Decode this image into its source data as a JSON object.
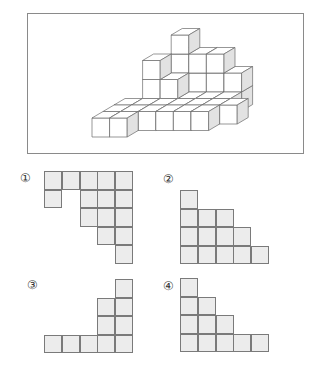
{
  "figure": {
    "frame": {
      "x": 27,
      "y": 13,
      "w": 277,
      "h": 141
    },
    "cube_style": {
      "front": "#ffffff",
      "top": "#ffffff",
      "side": "#e2e2e2",
      "stroke": "#6a6a6a"
    },
    "unit": {
      "w": 17.6,
      "h": 19,
      "dx": 11,
      "dy": -6.5
    },
    "origin": {
      "x": 92,
      "y": 137
    },
    "cubes": [
      [
        2,
        4,
        0
      ],
      [
        3,
        4,
        0
      ],
      [
        4,
        4,
        0
      ],
      [
        5,
        4,
        0
      ],
      [
        2,
        4,
        1
      ],
      [
        3,
        4,
        1
      ],
      [
        4,
        4,
        1
      ],
      [
        5,
        4,
        1
      ],
      [
        2,
        4,
        2
      ],
      [
        3,
        4,
        2
      ],
      [
        4,
        4,
        2
      ],
      [
        2,
        4,
        3
      ],
      [
        1,
        3,
        0
      ],
      [
        2,
        3,
        0
      ],
      [
        3,
        3,
        0
      ],
      [
        4,
        3,
        0
      ],
      [
        5,
        3,
        0
      ],
      [
        1,
        3,
        1
      ],
      [
        2,
        3,
        1
      ],
      [
        1,
        3,
        2
      ],
      [
        0,
        2,
        0
      ],
      [
        1,
        2,
        0
      ],
      [
        2,
        2,
        0
      ],
      [
        3,
        2,
        0
      ],
      [
        4,
        2,
        0
      ],
      [
        5,
        2,
        0
      ],
      [
        6,
        2,
        0
      ],
      [
        0,
        1,
        0
      ],
      [
        1,
        1,
        0
      ],
      [
        2,
        1,
        0
      ],
      [
        3,
        1,
        0
      ],
      [
        4,
        1,
        0
      ],
      [
        5,
        1,
        0
      ],
      [
        0,
        0,
        0
      ],
      [
        1,
        0,
        0
      ]
    ]
  },
  "options": [
    {
      "label": "①",
      "x": 44,
      "y": 171,
      "label_x": 20,
      "label_y": 172,
      "rows": [
        [
          1,
          1,
          1,
          1,
          1
        ],
        [
          1,
          0,
          1,
          1,
          1
        ],
        [
          0,
          0,
          1,
          1,
          1
        ],
        [
          0,
          0,
          0,
          1,
          1
        ],
        [
          0,
          0,
          0,
          0,
          1
        ]
      ]
    },
    {
      "label": "②",
      "x": 180,
      "y": 190,
      "label_x": 163,
      "label_y": 173,
      "rows": [
        [
          1,
          0,
          0,
          0,
          0
        ],
        [
          1,
          1,
          1,
          0,
          0
        ],
        [
          1,
          1,
          1,
          1,
          0
        ],
        [
          1,
          1,
          1,
          1,
          1
        ]
      ]
    },
    {
      "label": "③",
      "x": 44,
      "y": 279,
      "label_x": 27,
      "label_y": 279,
      "rows": [
        [
          0,
          0,
          0,
          0,
          1
        ],
        [
          0,
          0,
          0,
          1,
          1
        ],
        [
          0,
          0,
          0,
          1,
          1
        ],
        [
          1,
          1,
          1,
          1,
          1
        ]
      ]
    },
    {
      "label": "④",
      "x": 180,
      "y": 278,
      "label_x": 163,
      "label_y": 280,
      "rows": [
        [
          1,
          0,
          0,
          0,
          0
        ],
        [
          1,
          1,
          0,
          0,
          0
        ],
        [
          1,
          1,
          1,
          0,
          0
        ],
        [
          1,
          1,
          1,
          1,
          1
        ]
      ]
    }
  ]
}
